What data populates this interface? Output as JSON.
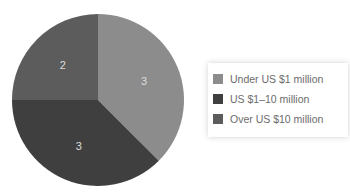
{
  "chart_data": {
    "type": "pie",
    "title": "",
    "categories": [
      "Under US $1 million",
      "US $1–10 million",
      "Over US $10 million"
    ],
    "values": [
      3,
      3,
      2
    ],
    "colors": [
      "#8c8c8c",
      "#3f3f3f",
      "#5c5c5c"
    ],
    "start_angle_deg": 0,
    "direction": "clockwise",
    "data_labels": [
      "3",
      "3",
      "2"
    ],
    "legend_position": "right"
  },
  "legend": {
    "items": [
      {
        "label": "Under US $1 million",
        "color": "#8c8c8c"
      },
      {
        "label": "US $1–10 million",
        "color": "#3f3f3f"
      },
      {
        "label": "Over US $10 million",
        "color": "#5c5c5c"
      }
    ]
  }
}
